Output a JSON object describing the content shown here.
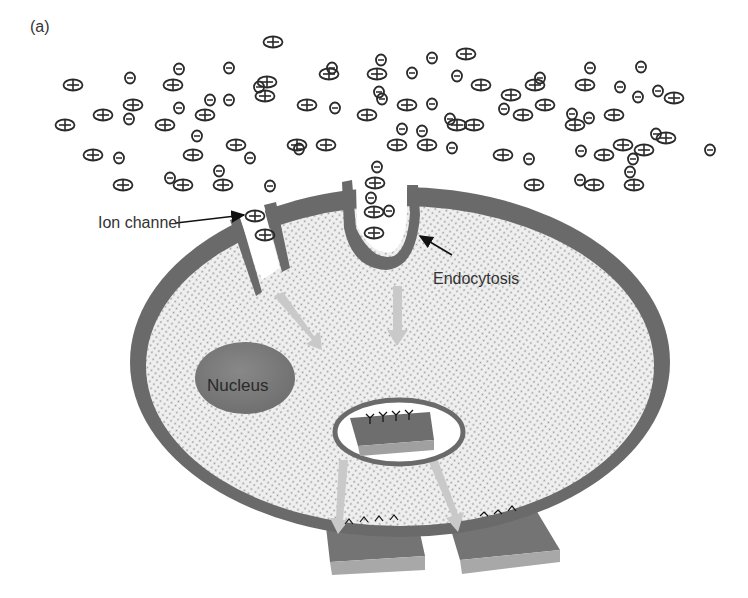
{
  "figure": {
    "panel_label": "(a)",
    "labels": {
      "ion_channel": "Ion channel",
      "endocytosis": "Endocytosis",
      "nucleus": "Nucleus"
    },
    "colors": {
      "membrane": "#6a6a6a",
      "cytoplasm": "#ececec",
      "cytoplasm_dots": "#9a9a9a",
      "nucleus": "#7c7c7c",
      "transport_arrow": "#c8c8c8",
      "ion_stroke": "#2a2a2a",
      "chip_top": "#6e6e6e",
      "chip_side": "#a0a0a0"
    },
    "legend": {
      "positive_ion": "+",
      "negative_ion": "-"
    }
  }
}
